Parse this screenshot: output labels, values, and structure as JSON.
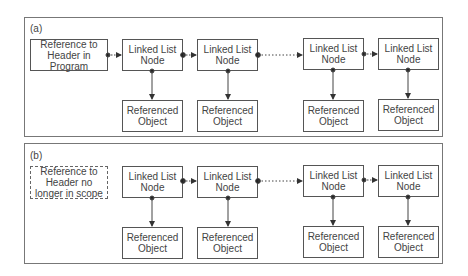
{
  "panels": [
    {
      "label": "(a)",
      "header": "Reference to\nHeader in Program",
      "nodes": [
        "Linked List\nNode",
        "Linked List\nNode",
        "Linked List\nNode",
        "Linked List\nNode"
      ],
      "objects": [
        "Referenced\nObject",
        "Referenced\nObject",
        "Referenced\nObject",
        "Referenced\nObject"
      ]
    },
    {
      "label": "(b)",
      "header": "Reference to\nHeader no\nlonger in scope",
      "nodes": [
        "Linked List\nNode",
        "Linked List\nNode",
        "Linked List\nNode",
        "Linked List\nNode"
      ],
      "objects": [
        "Referenced\nObject",
        "Referenced\nObject",
        "Referenced\nObject",
        "Referenced\nObject"
      ]
    }
  ]
}
